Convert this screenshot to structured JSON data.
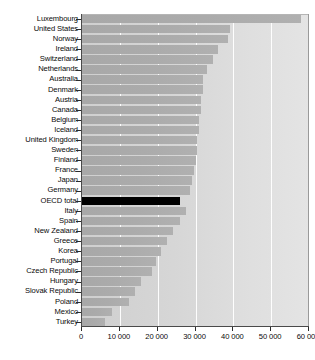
{
  "chart_data": {
    "type": "bar",
    "orientation": "horizontal",
    "title": "",
    "subtitle": "",
    "xlabel": "",
    "ylabel": "",
    "xlim": [
      0,
      60000
    ],
    "xticks": [
      0,
      10000,
      20000,
      30000,
      40000,
      50000,
      60000
    ],
    "xtick_labels": [
      "0",
      "10 000",
      "20 000",
      "30 000",
      "40 000",
      "50 000",
      "60 000"
    ],
    "grid": true,
    "grid_axis": "x",
    "legend": false,
    "legend_position": "none",
    "highlight_category": "OECD total",
    "colors": {
      "bar": "#ababab",
      "highlight_bar": "#000000",
      "plot_background": "#d6d6d6",
      "gridline": "#ffffff",
      "axis": "#2b2b2b",
      "text": "#0a0a0a"
    },
    "categories": [
      "Luxembourg",
      "United States",
      "Norway",
      "Ireland",
      "Switzerland",
      "Netherlands",
      "Australia",
      "Denmark",
      "Austria",
      "Canada",
      "Belgium",
      "Iceland",
      "United Kingdom",
      "Sweden",
      "Finland",
      "France",
      "Japan",
      "Germany",
      "OECD total",
      "Italy",
      "Spain",
      "New Zealand",
      "Greece",
      "Korea",
      "Portugal",
      "Czech Republic",
      "Hungary",
      "Slovak Republic",
      "Poland",
      "Mexico",
      "Turkey"
    ],
    "values": [
      58000,
      39000,
      38500,
      36000,
      34500,
      33000,
      32000,
      32000,
      31500,
      31500,
      31000,
      31000,
      30500,
      30500,
      30000,
      29500,
      29000,
      28500,
      26000,
      27500,
      26000,
      24000,
      22500,
      21000,
      19500,
      18500,
      15500,
      14000,
      12500,
      8000,
      6000
    ]
  },
  "axis": {
    "tick_labels": [
      "0",
      "10 000",
      "20 000",
      "30 000",
      "40 000",
      "50 000",
      "60 000"
    ]
  }
}
